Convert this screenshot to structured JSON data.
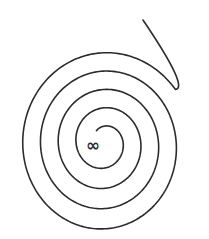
{
  "diagram": {
    "type": "spiral",
    "turns": 4.3,
    "stroke_color": "#2b2b2b",
    "background_color": "#ffffff",
    "center_symbol": "∞",
    "center_symbol_name": "infinity-symbol"
  }
}
